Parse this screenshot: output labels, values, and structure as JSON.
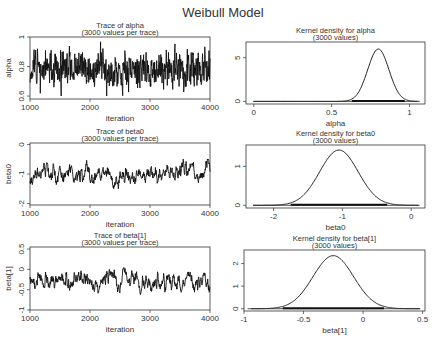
{
  "title": "Weibull Model",
  "chart_data": [
    {
      "type": "line",
      "title": "Trace of alpha",
      "subtitle": "(3000 values per trace)",
      "xlabel": "iteration",
      "ylabel": "alpha",
      "xlim": [
        1000,
        4000
      ],
      "ylim": [
        0.58,
        1.0
      ],
      "xticks": [
        1000,
        2000,
        3000,
        4000
      ],
      "yticks": [
        0.6,
        0.8,
        1
      ],
      "ytick_labels": [
        "0.6",
        "0.8",
        "1"
      ],
      "series_summary": {
        "mean": 0.78,
        "min": 0.6,
        "max": 0.98
      },
      "box": [
        30,
        37,
        210,
        99
      ],
      "seed": 11,
      "noise": 0.06,
      "ar": 0.4
    },
    {
      "type": "line",
      "title": "Kernel density for alpha",
      "subtitle": "(3000 values)",
      "xlabel": "alpha",
      "ylabel": "",
      "xlim": [
        -0.05,
        1.1
      ],
      "ylim": [
        -0.3,
        6.8
      ],
      "xticks": [
        0,
        0.5,
        1
      ],
      "xtick_labels": [
        "0",
        "0.5",
        "1"
      ],
      "yticks": [
        0,
        5
      ],
      "density": {
        "mean": 0.8,
        "sd": 0.068,
        "peak": 6.0
      },
      "rug_range": [
        0.0,
        1.05
      ],
      "box": [
        246,
        42,
        425,
        104
      ]
    },
    {
      "type": "line",
      "title": "Trace of beta0",
      "subtitle": "(3000 values per trace)",
      "xlabel": "iteration",
      "ylabel": "beta0",
      "xlim": [
        1000,
        4000
      ],
      "ylim": [
        -2.05,
        0.05
      ],
      "xticks": [
        1000,
        2000,
        3000,
        4000
      ],
      "yticks": [
        -2,
        -1,
        0
      ],
      "ytick_labels": [
        "-2",
        "-1",
        "0"
      ],
      "series_summary": {
        "mean": -1.05,
        "min": -1.95,
        "max": -0.35
      },
      "box": [
        30,
        143,
        210,
        205
      ],
      "seed": 23,
      "noise": 0.09,
      "ar": 0.85
    },
    {
      "type": "line",
      "title": "Kernel density for beta0",
      "subtitle": "(3000 values)",
      "xlabel": "beta0",
      "ylabel": "",
      "xlim": [
        -2.4,
        0.2
      ],
      "ylim": [
        -0.07,
        1.55
      ],
      "xticks": [
        -2,
        -1,
        0
      ],
      "xtick_labels": [
        "-2",
        "-1",
        "0"
      ],
      "yticks": [
        0,
        1
      ],
      "density": {
        "mean": -1.05,
        "sd": 0.28,
        "peak": 1.42
      },
      "rug_range": [
        -2.3,
        0.1
      ],
      "box": [
        246,
        145,
        425,
        208
      ]
    },
    {
      "type": "line",
      "title": "Trace of beta[1]",
      "subtitle": "(3000 values per trace)",
      "xlabel": "iteration",
      "ylabel": "beta[1]",
      "xlim": [
        1000,
        4000
      ],
      "ylim": [
        -1.0,
        0.55
      ],
      "xticks": [
        1000,
        2000,
        3000,
        4000
      ],
      "yticks": [
        -1,
        -0.5,
        0,
        0.5
      ],
      "ytick_labels": [
        "-1",
        "-0.5",
        "0",
        "0.5"
      ],
      "series_summary": {
        "mean": -0.27,
        "min": -0.78,
        "max": 0.3
      },
      "box": [
        30,
        247,
        210,
        310
      ],
      "seed": 37,
      "noise": 0.07,
      "ar": 0.8
    },
    {
      "type": "line",
      "title": "Kernel density for beta[1]",
      "subtitle": "(3000 values)",
      "xlabel": "beta[1]",
      "ylabel": "",
      "xlim": [
        -1.0,
        0.52
      ],
      "ylim": [
        -0.1,
        2.6
      ],
      "xticks": [
        -1,
        -0.5,
        0,
        0.5
      ],
      "xtick_labels": [
        "-1",
        "-0.5",
        "0",
        "0.5"
      ],
      "yticks": [
        0,
        1,
        2
      ],
      "density": {
        "mean": -0.25,
        "sd": 0.17,
        "peak": 2.35
      },
      "rug_range": [
        -0.97,
        0.48
      ],
      "box": [
        244,
        250,
        425,
        311
      ]
    }
  ]
}
